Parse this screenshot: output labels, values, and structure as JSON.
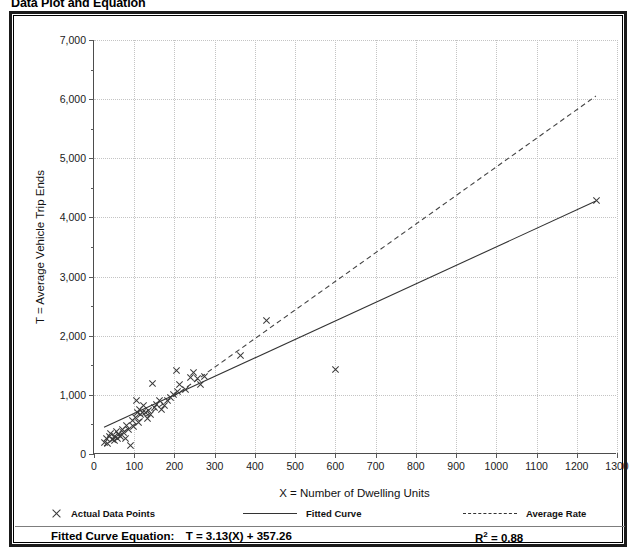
{
  "title": "Data Plot and Equation",
  "axes": {
    "x_title": "X = Number of Dwelling Units",
    "y_title": "T = Average Vehicle Trip Ends",
    "x_ticks": [
      "0",
      "100",
      "200",
      "300",
      "400",
      "500",
      "600",
      "700",
      "800",
      "900",
      "1000",
      "1100",
      "1200",
      "1300"
    ],
    "y_ticks": [
      "0",
      "1,000",
      "2,000",
      "3,000",
      "4,000",
      "5,000",
      "6,000",
      "7,000"
    ]
  },
  "legend": {
    "data_points": "Actual Data Points",
    "fitted_curve": "Fitted Curve",
    "average_rate": "Average Rate"
  },
  "equation": {
    "fitted_label": "Fitted Curve Equation:",
    "fitted_value": "T = 3.13(X) + 357.26",
    "r2_label": "R",
    "r2_exp": "2",
    "r2_value": "= 0.88"
  },
  "colors": {
    "frame": "#1a1a1a",
    "grid": "#c4c4c4",
    "axis": "#4d4d4d",
    "marker": "#3a3a3a",
    "fitted_line": "#333333",
    "average_line": "#444444"
  },
  "chart_data": {
    "type": "scatter",
    "title": "Data Plot and Equation",
    "xlabel": "X = Number of Dwelling Units",
    "ylabel": "T = Average Vehicle Trip Ends",
    "xlim": [
      0,
      1300
    ],
    "ylim": [
      0,
      7000
    ],
    "x_tick_step": 100,
    "y_tick_step": 1000,
    "y_minor_tick_step": 500,
    "grid": true,
    "legend_position": "below-axes",
    "series": [
      {
        "name": "Actual Data Points",
        "type": "scatter",
        "marker": "x",
        "points": [
          [
            25,
            200
          ],
          [
            30,
            265
          ],
          [
            33,
            175
          ],
          [
            38,
            300
          ],
          [
            42,
            340
          ],
          [
            45,
            250
          ],
          [
            50,
            225
          ],
          [
            52,
            300
          ],
          [
            55,
            380
          ],
          [
            58,
            265
          ],
          [
            62,
            330
          ],
          [
            66,
            290
          ],
          [
            70,
            420
          ],
          [
            74,
            360
          ],
          [
            78,
            255
          ],
          [
            82,
            480
          ],
          [
            86,
            410
          ],
          [
            90,
            140
          ],
          [
            95,
            560
          ],
          [
            98,
            470
          ],
          [
            102,
            620
          ],
          [
            105,
            900
          ],
          [
            108,
            700
          ],
          [
            110,
            540
          ],
          [
            113,
            760
          ],
          [
            116,
            660
          ],
          [
            120,
            700
          ],
          [
            124,
            820
          ],
          [
            128,
            710
          ],
          [
            132,
            600
          ],
          [
            136,
            740
          ],
          [
            140,
            660
          ],
          [
            145,
            1200
          ],
          [
            150,
            780
          ],
          [
            156,
            840
          ],
          [
            162,
            900
          ],
          [
            168,
            760
          ],
          [
            175,
            820
          ],
          [
            182,
            900
          ],
          [
            190,
            960
          ],
          [
            198,
            1000
          ],
          [
            205,
            1410
          ],
          [
            208,
            1050
          ],
          [
            212,
            1180
          ],
          [
            228,
            1090
          ],
          [
            240,
            1300
          ],
          [
            248,
            1380
          ],
          [
            258,
            1270
          ],
          [
            265,
            1180
          ],
          [
            275,
            1310
          ],
          [
            365,
            1660
          ],
          [
            430,
            2250
          ],
          [
            600,
            1430
          ],
          [
            1250,
            4280
          ]
        ]
      },
      {
        "name": "Fitted Curve",
        "type": "line",
        "style": "solid",
        "equation": "T = 3.13(X) + 357.26",
        "r_squared": 0.88,
        "x_range": [
          25,
          1250
        ],
        "endpoints": [
          [
            25,
            435
          ],
          [
            1250,
            4270
          ]
        ]
      },
      {
        "name": "Average Rate",
        "type": "line",
        "style": "dashed",
        "x_range": [
          25,
          1250
        ],
        "endpoints": [
          [
            25,
            120
          ],
          [
            1250,
            6050
          ]
        ]
      }
    ]
  }
}
